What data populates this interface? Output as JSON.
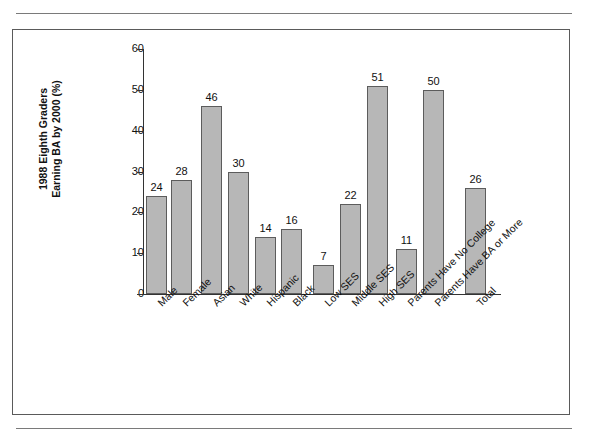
{
  "page": {
    "clipped_header_text": "          ,                     ,      ,      ,    g   p        p"
  },
  "chart_data": {
    "type": "bar",
    "title": "",
    "xlabel": "",
    "ylabel": "1988 Eighth Graders\nEarning BA by 2000 (%)",
    "ylim": [
      0,
      60
    ],
    "yticks": [
      0,
      10,
      20,
      30,
      40,
      50,
      60
    ],
    "ytick_labels": [
      "0",
      "10",
      "20",
      "30",
      "40",
      "50",
      "60"
    ],
    "grid": false,
    "legend": "none",
    "categories": [
      "Male",
      "Female",
      "Asian",
      "White",
      "Hispanic",
      "Black",
      "Low SES",
      "Middle SES",
      "High SES",
      "Parents Have No College",
      "Parents Have BA or More",
      "Total"
    ],
    "values": [
      24,
      28,
      46,
      30,
      14,
      16,
      7,
      22,
      51,
      11,
      50,
      26
    ],
    "value_labels": [
      "24",
      "28",
      "46",
      "30",
      "14",
      "16",
      "7",
      "22",
      "51",
      "11",
      "50",
      "26"
    ],
    "groups": [
      {
        "name": "Gender",
        "members": [
          "Male",
          "Female"
        ]
      },
      {
        "name": "Race/Ethnicity",
        "members": [
          "Asian",
          "White",
          "Hispanic",
          "Black"
        ]
      },
      {
        "name": "Socioeconomic Status",
        "members": [
          "Low SES",
          "Middle SES",
          "High SES"
        ]
      },
      {
        "name": "Parent Education",
        "members": [
          "Parents Have No College",
          "Parents Have BA or More"
        ]
      },
      {
        "name": "Overall",
        "members": [
          "Total"
        ]
      }
    ],
    "colors": {
      "bar_fill": "#b7b7b7",
      "bar_stroke": "#5c5c5c",
      "axis": "#333333",
      "text": "#111111",
      "frame": "#5a5a5a",
      "rule": "#7a7a7a",
      "background": "#ffffff"
    },
    "bar_geometry": {
      "axis_left_px": 130,
      "baseline_top_px": 264,
      "px_per_unit": 4.08,
      "bar_width_px": 21,
      "bar_lefts_px": [
        133,
        158,
        188,
        215,
        242,
        268,
        300,
        327,
        354,
        383,
        410,
        452
      ]
    }
  }
}
